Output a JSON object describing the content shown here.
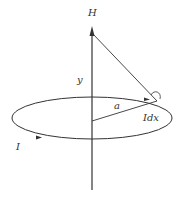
{
  "diagram": {
    "labels": {
      "field": "H",
      "axis_distance": "y",
      "radius": "a",
      "current_element": "Idx",
      "current": "I"
    },
    "colors": {
      "stroke": "#333333",
      "background": "#ffffff"
    }
  }
}
